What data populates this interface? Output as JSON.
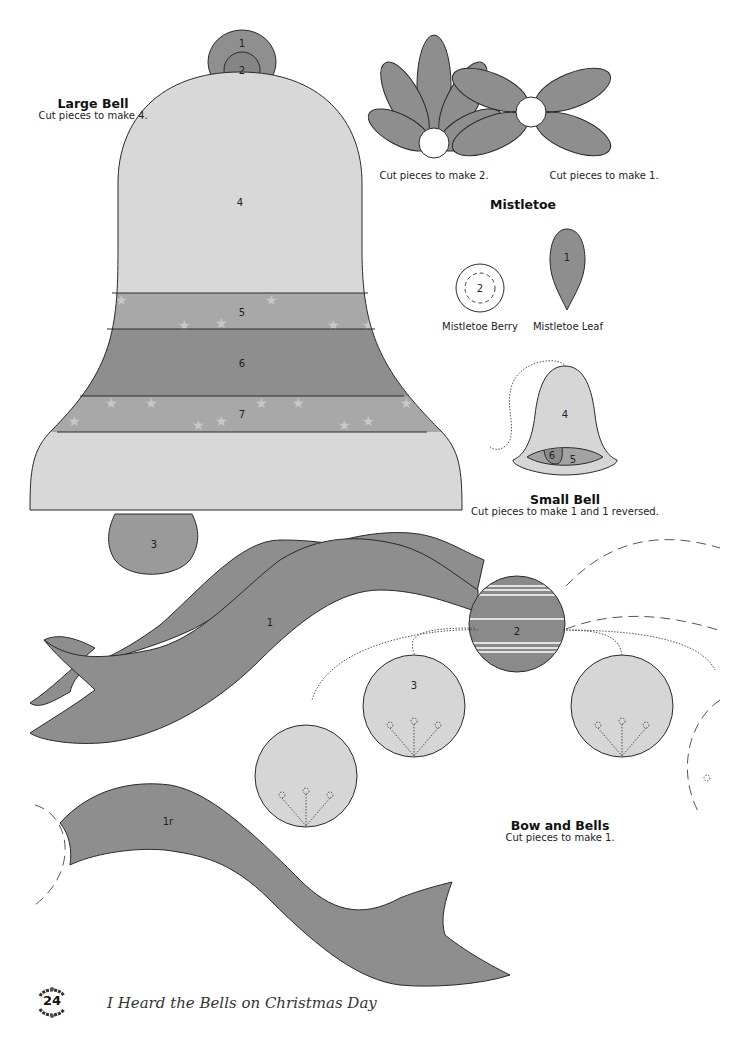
{
  "page": {
    "number": "24",
    "footer_title": "I Heard the Bells on Christmas Day"
  },
  "colors": {
    "dark_fill": "#8c8c8c",
    "mid_fill": "#a3a3a3",
    "light_fill": "#d6d6d6",
    "outline": "#2a2a2a",
    "star": "#c8c8c8"
  },
  "large_bell": {
    "title": "Large Bell",
    "instruction": "Cut pieces to make 4.",
    "pieces": [
      "1",
      "2",
      "3",
      "4",
      "5",
      "6",
      "7"
    ]
  },
  "mistletoe": {
    "title": "Mistletoe",
    "cluster_left_caption": "Cut pieces to make 2.",
    "cluster_right_caption": "Cut pieces to make 1.",
    "berry_label": "Mistletoe Berry",
    "berry_piece": "2",
    "leaf_label": "Mistletoe Leaf",
    "leaf_piece": "1"
  },
  "small_bell": {
    "title": "Small Bell",
    "instruction": "Cut pieces to make 1 and 1 reversed.",
    "pieces": [
      "4",
      "6",
      "5"
    ]
  },
  "bow_and_bells": {
    "title": "Bow and Bells",
    "instruction": "Cut pieces to make 1.",
    "pieces": [
      "1",
      "2",
      "3",
      "1r"
    ]
  }
}
